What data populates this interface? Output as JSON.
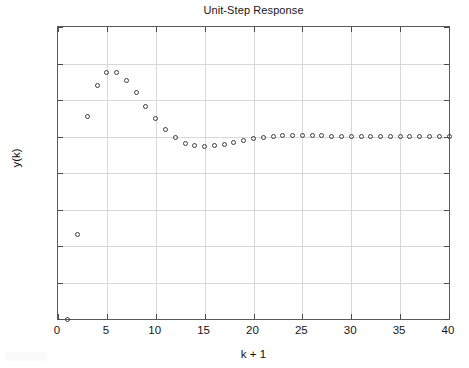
{
  "chart_data": {
    "type": "scatter",
    "title": "Unit-Step Response",
    "xlabel": "k + 1",
    "ylabel": "y(k)",
    "marker": "open-circle",
    "grid": true,
    "legend": null,
    "xlim": [
      0,
      40
    ],
    "ylim": [
      0,
      1.6
    ],
    "xticks": [
      0,
      5,
      10,
      15,
      20,
      25,
      30,
      35,
      40
    ],
    "xtick_labels": [
      "0",
      "5",
      "10",
      "15",
      "20",
      "25",
      "30",
      "35",
      "40"
    ],
    "yticks": [
      0,
      0.2,
      0.4,
      0.6,
      0.8,
      1,
      1.2,
      1.4,
      1.6
    ],
    "ytick_labels": [
      "0",
      "0.2",
      "0.4",
      "0.6",
      "0.8",
      "1",
      "1.2",
      "1.4",
      "1.6"
    ],
    "x": [
      1,
      2,
      3,
      4,
      5,
      6,
      7,
      8,
      9,
      10,
      11,
      12,
      13,
      14,
      15,
      16,
      17,
      18,
      19,
      20,
      21,
      22,
      23,
      24,
      25,
      26,
      27,
      28,
      29,
      30,
      31,
      32,
      33,
      34,
      35,
      36,
      37,
      38,
      39,
      40
    ],
    "y": [
      0.0,
      0.465,
      1.112,
      1.277,
      1.35,
      1.352,
      1.308,
      1.243,
      1.167,
      1.096,
      1.036,
      0.993,
      0.963,
      0.949,
      0.945,
      0.949,
      0.958,
      0.969,
      0.979,
      0.988,
      0.996,
      1.001,
      1.004,
      1.006,
      1.006,
      1.005,
      1.004,
      1.002,
      1.001,
      1.0,
      0.999,
      0.999,
      0.999,
      0.999,
      0.999,
      1.0,
      1.0,
      1.0,
      1.0,
      1.0
    ],
    "series_name": "y(k)",
    "marker_color": "#3c3c3c",
    "grid_color": "#d8d8d8",
    "axis_color": "#5a5a5a",
    "background": "#ffffff"
  },
  "figure": {
    "title": "Unit-Step Response",
    "xlabel": "k + 1",
    "ylabel": "y(k)"
  }
}
